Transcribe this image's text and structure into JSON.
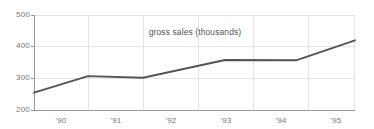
{
  "chart_data": {
    "type": "line",
    "title": "gross sales (thousands)",
    "xlabel": "",
    "ylabel": "",
    "x": [
      "'90",
      "'91",
      "'92",
      "'93",
      "'94",
      "'95"
    ],
    "categories": [
      "'90",
      "'91",
      "'92",
      "'93",
      "'94",
      "'95"
    ],
    "values": [
      255,
      307,
      302,
      358,
      357,
      420
    ],
    "series": [
      {
        "name": "gross sales (thousands)",
        "values": [
          255,
          307,
          302,
          358,
          357,
          420
        ]
      }
    ],
    "points": [
      {
        "x_px": 34,
        "value": 255
      },
      {
        "x_px": 88,
        "value": 307
      },
      {
        "x_px": 143,
        "value": 302
      },
      {
        "x_px": 225,
        "value": 358
      },
      {
        "x_px": 296,
        "value": 357
      },
      {
        "x_px": 355,
        "value": 420
      }
    ],
    "ylim": [
      200,
      500
    ],
    "yticks": [
      200,
      300,
      400,
      500
    ],
    "ytick_labels": [
      "200",
      "300",
      "400",
      "500"
    ],
    "xtick_labels": [
      "'90",
      "'91",
      "'92",
      "'93",
      "'94",
      "'95"
    ],
    "grid": true,
    "legend": "none",
    "line_color": "#555555",
    "grid_color": "#e2e2e2",
    "axis_color": "#9a9a9a",
    "tick_label_color": "#777777",
    "title_color": "#555555",
    "background": "#ffffff"
  },
  "axis": {
    "y_ticks": [
      {
        "label": "500",
        "y_px": 15
      },
      {
        "label": "400",
        "y_px": 46
      },
      {
        "label": "300",
        "y_px": 78
      },
      {
        "label": "200",
        "y_px": 110
      }
    ],
    "x_ticks": [
      {
        "label": "'90",
        "x_px": 61
      },
      {
        "label": "'91",
        "x_px": 116
      },
      {
        "label": "'92",
        "x_px": 171
      },
      {
        "label": "'93",
        "x_px": 226
      },
      {
        "label": "'94",
        "x_px": 281
      },
      {
        "label": "'95",
        "x_px": 336
      }
    ]
  }
}
